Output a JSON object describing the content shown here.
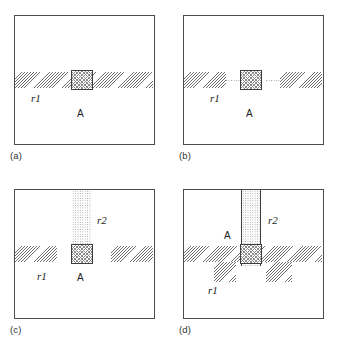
{
  "figure": {
    "title": "",
    "background_color": "#ffffff",
    "panel_border_color": "#4c4c4c",
    "hatch_color": "#6f6f6f",
    "stipple_color": "#9a9a9a",
    "checker_color": "#8a8a8a"
  },
  "panels": [
    {
      "caption": "(a)",
      "labels": {
        "r1": "r1",
        "a": "A"
      }
    },
    {
      "caption": "(b)",
      "labels": {
        "r1": "r1",
        "a": "A"
      }
    },
    {
      "caption": "(c)",
      "labels": {
        "r1": "r1",
        "r2": "r2",
        "a": "A"
      }
    },
    {
      "caption": "(d)",
      "labels": {
        "r1": "r1",
        "r2": "r2",
        "a": "A"
      }
    }
  ]
}
